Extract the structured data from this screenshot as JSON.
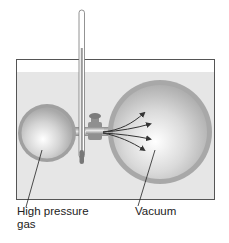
{
  "diagram": {
    "labels": {
      "left_bulb": "High pressure gas",
      "left_bulb_line1": "High pressure",
      "left_bulb_line2": "gas",
      "right_bulb": "Vacuum"
    },
    "components": [
      "water-bath",
      "thermometer",
      "small-bulb",
      "large-bulb",
      "valve",
      "gas-flow-arrows"
    ],
    "colors": {
      "water": "#e6e6e6",
      "tank_border": "#555555",
      "bulb_rim": "#9a9a9a",
      "bulb_highlight": "#ffffff",
      "arrow": "#333333"
    }
  }
}
